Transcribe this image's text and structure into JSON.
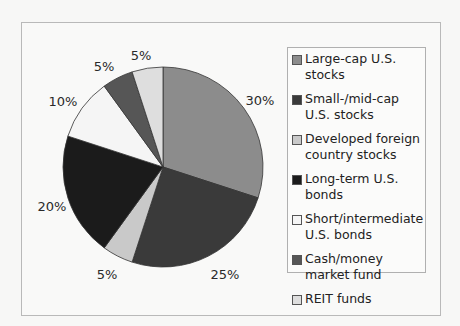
{
  "chart_data": {
    "type": "pie",
    "title": "",
    "start_angle_deg": 0,
    "direction": "clockwise",
    "categories": [
      "Large-cap U.S. stocks",
      "Small-/mid-cap U.S. stocks",
      "Developed foreign country stocks",
      "Long-term U.S. bonds",
      "Short/intermediate U.S. bonds",
      "Cash/money market fund",
      "REIT funds"
    ],
    "values": [
      30,
      25,
      5,
      20,
      10,
      5,
      5
    ],
    "labels": [
      "30%",
      "25%",
      "5%",
      "20%",
      "10%",
      "5%",
      "5%"
    ],
    "colors": [
      "#8c8c8c",
      "#3a3a3a",
      "#c9c9c9",
      "#1b1b1b",
      "#f5f5f5",
      "#565656",
      "#dedede"
    ],
    "legend_position": "right"
  },
  "legend": {
    "items": [
      {
        "label": "Large-cap U.S. stocks",
        "color": "#8c8c8c"
      },
      {
        "label": "Small-/mid-cap U.S. stocks",
        "color": "#3a3a3a"
      },
      {
        "label": "Developed foreign country stocks",
        "color": "#c9c9c9"
      },
      {
        "label": "Long-term U.S. bonds",
        "color": "#1b1b1b"
      },
      {
        "label": "Short/intermediate U.S. bonds",
        "color": "#f5f5f5"
      },
      {
        "label": "Cash/money market fund",
        "color": "#565656"
      },
      {
        "label": "REIT funds",
        "color": "#dedede"
      }
    ]
  },
  "pie_labels": [
    {
      "text": "30%",
      "x": 260,
      "y": 100
    },
    {
      "text": "25%",
      "x": 225,
      "y": 274
    },
    {
      "text": "5%",
      "x": 107,
      "y": 274
    },
    {
      "text": "20%",
      "x": 52,
      "y": 206
    },
    {
      "text": "10%",
      "x": 63,
      "y": 101
    },
    {
      "text": "5%",
      "x": 104,
      "y": 66
    },
    {
      "text": "5%",
      "x": 141,
      "y": 55
    }
  ]
}
